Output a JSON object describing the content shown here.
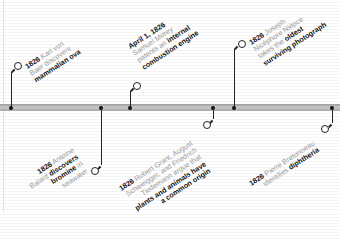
{
  "timeline": {
    "events": [
      {
        "id": "baer",
        "date": "1826",
        "lines": [
          "Karl von",
          "Baer discovers"
        ],
        "bold": "mammalian ova",
        "position": "above"
      },
      {
        "id": "morey",
        "date": "April 1, 1826",
        "lines": [
          "Samuel Morey",
          "patents an"
        ],
        "bold_inline": "internal",
        "bold": "combustion engine",
        "position": "above"
      },
      {
        "id": "niepce",
        "date": "1826",
        "lines": [
          "Joseph",
          "Nicéphore Niépce",
          "takes the"
        ],
        "bold_inline": "oldest",
        "bold": "surviving photograph",
        "position": "above"
      },
      {
        "id": "balard",
        "date": "1826",
        "lines": [
          "Antoine",
          "Balard"
        ],
        "bold_inline": "discovers",
        "bold": "bromine",
        "tail": "in",
        "last": "seawater",
        "position": "below"
      },
      {
        "id": "grant",
        "date": "1826",
        "lines": [
          "Robert Grant, August",
          "Schweigger, and Friedrich",
          "Tiedemann argue that"
        ],
        "bold": "plants and animals have",
        "bold2": "a common origin",
        "position": "below"
      },
      {
        "id": "bretonneau",
        "date": "1826",
        "lines": [
          "Pierre Bretonneau",
          "identifies"
        ],
        "bold": "diphtheria",
        "position": "below"
      }
    ]
  },
  "text": {
    "baer_date": "1826",
    "baer_l1": " Karl von",
    "baer_l2": "Baer discovers",
    "baer_b": "mammalian ova",
    "morey_date": "April 1, 1826",
    "morey_l1": "Samuel Morey",
    "morey_l2": "patents an ",
    "morey_bi": "internal",
    "morey_b": "combustion engine",
    "niepce_date": "1826",
    "niepce_l1": " Joseph",
    "niepce_l2": "Nicéphore Niépce",
    "niepce_l3": "takes the ",
    "niepce_bi": "oldest",
    "niepce_b": "surviving photograph",
    "balard_date": "1826",
    "balard_l1": " Antoine",
    "balard_l2": "Balard ",
    "balard_bi": "discovers",
    "balard_b": "bromine",
    "balard_t": " in",
    "balard_l3": "seawater",
    "grant_date": "1826",
    "grant_l1": " Robert Grant, August",
    "grant_l2": "Schweigger, and Friedrich",
    "grant_l3": "Tiedemann argue that",
    "grant_b1": "plants and animals have",
    "grant_b2": "a common origin",
    "bret_date": "1826",
    "bret_l1": " Pierre Bretonneau",
    "bret_l2": "identifies ",
    "bret_b": "diphtheria"
  },
  "colors": {
    "bar": "#b0b0b0",
    "stem": "#222222",
    "text_light": "#9a9a9a",
    "text_bold": "#111111"
  }
}
